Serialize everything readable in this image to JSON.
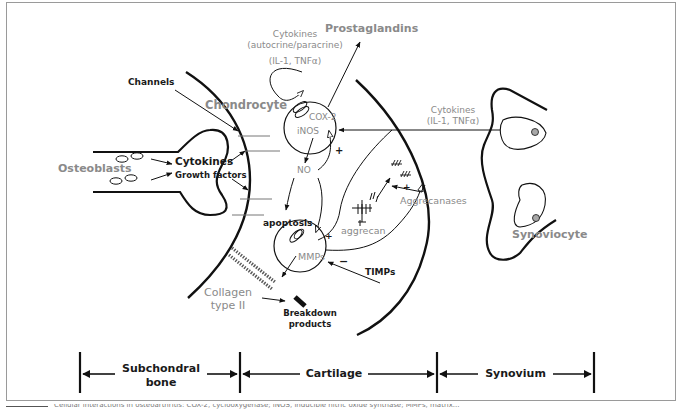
{
  "diagram": {
    "labels": {
      "cytokines_autocrine": "Cytokines",
      "autocrine_paracrine": "(autocrine/paracrine)",
      "il1_tnf_top": "(IL-1, TNFα)",
      "prostaglandins": "Prostaglandins",
      "channels": "Channels",
      "chondrocyte": "Chondrocyte",
      "cox2": "COX-2",
      "inos": "iNOS",
      "no": "NO",
      "cytokines_synovium": "Cytokines",
      "il1_tnf_right": "(IL-1, TNFα)",
      "osteoblasts": "Osteoblasts",
      "cytokines_bone": "Cytokines",
      "growth_factors": "Growth factors",
      "aggrecanases": "Aggrecanases",
      "apoptosis": "apoptosis",
      "aggrecan": "aggrecan",
      "mmps": "MMPs",
      "timps": "TIMPs",
      "synoviocyte": "Synoviocyte",
      "collagen": "Collagen",
      "type_ii": "type II",
      "breakdown": "Breakdown",
      "products": "products",
      "plus_1": "+",
      "plus_2": "+",
      "plus_3": "+",
      "minus_1": "−"
    },
    "regions": [
      {
        "line1": "Subchondral",
        "line2": "bone"
      },
      {
        "line1": "Cartilage"
      },
      {
        "line1": "Synovium"
      }
    ],
    "colors": {
      "grey_text": "#8a8a8a",
      "dark_text": "#1a1a1a",
      "nucleus_fill": "#a8a8a8",
      "frame": "#9a9a9a"
    }
  },
  "caption": {
    "text": "Cellular interactions in osteoarthritis: COX-2, cyclooxygenase; iNOS, inducible nitric oxide synthase; MMPs, matrix..."
  }
}
